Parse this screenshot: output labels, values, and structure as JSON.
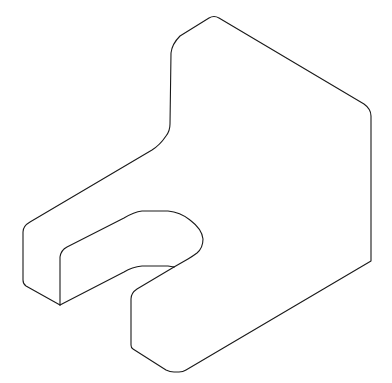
{
  "drawing": {
    "type": "isometric-line-drawing",
    "subject": "block with rounded corners and U-shaped slot",
    "stroke_color": "#1a1a1a",
    "background_color": "#ffffff"
  }
}
